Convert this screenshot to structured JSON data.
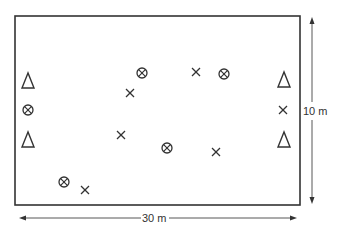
{
  "diagram": {
    "field": {
      "x": 15,
      "y": 16,
      "width": 285,
      "height": 189,
      "stroke": "#333333"
    },
    "dimensions": {
      "height_label": "10 m",
      "width_label": "30 m"
    },
    "markers": {
      "triangles": [
        {
          "x": 28,
          "y": 81
        },
        {
          "x": 28,
          "y": 140
        },
        {
          "x": 284,
          "y": 80
        },
        {
          "x": 284,
          "y": 140
        }
      ],
      "circled_crosses": [
        {
          "x": 28,
          "y": 110
        },
        {
          "x": 142,
          "y": 73
        },
        {
          "x": 224,
          "y": 74
        },
        {
          "x": 167,
          "y": 148
        },
        {
          "x": 64,
          "y": 182
        }
      ],
      "crosses": [
        {
          "x": 283,
          "y": 110
        },
        {
          "x": 196,
          "y": 72
        },
        {
          "x": 130,
          "y": 93
        },
        {
          "x": 121,
          "y": 135
        },
        {
          "x": 216,
          "y": 152
        },
        {
          "x": 85,
          "y": 190
        }
      ]
    },
    "colors": {
      "ink": "#333333",
      "background": "#ffffff"
    }
  }
}
